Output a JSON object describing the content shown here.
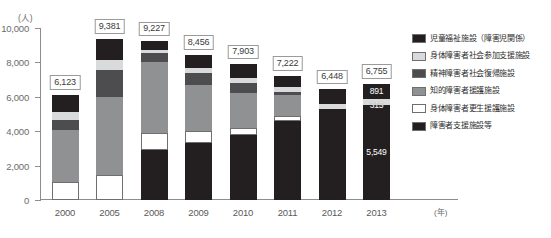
{
  "chart_data": {
    "type": "bar",
    "subtype": "stacked-vertical",
    "title": "",
    "subtitle": "",
    "xlabel": "(年)",
    "ylabel": "(人)",
    "ylim": [
      0,
      10000
    ],
    "ytick_labels": [
      "10,000",
      "8,000",
      "6,000",
      "4,000",
      "2,000",
      "0"
    ],
    "ytick_values": [
      10000,
      8000,
      6000,
      4000,
      2000,
      0
    ],
    "grid": false,
    "legend_position": "right",
    "categories": [
      "2000",
      "2005",
      "2008",
      "2009",
      "2010",
      "2011",
      "2012",
      "2013"
    ],
    "totals": [
      6123,
      9381,
      9227,
      8456,
      7903,
      7222,
      6448,
      6755
    ],
    "total_labels": [
      "6,123",
      "9,381",
      "9,227",
      "8,456",
      "7,903",
      "7,222",
      "6,448",
      "6,755"
    ],
    "series": [
      {
        "name": "障害者支援施設等",
        "color": "#231f20",
        "values": [
          0,
          0,
          2880,
          3320,
          3760,
          4620,
          5280,
          5549
        ]
      },
      {
        "name": "身体障害者更生援護施設",
        "color": "#ffffff",
        "values": [
          1060,
          1440,
          1010,
          700,
          430,
          290,
          0,
          0
        ]
      },
      {
        "name": "知的障害者援護施設",
        "color": "#8f9193",
        "values": [
          3000,
          4560,
          4130,
          2660,
          2030,
          1220,
          0,
          0
        ]
      },
      {
        "name": "精神障害者社会復帰施設",
        "color": "#4d4d4f",
        "values": [
          580,
          1570,
          510,
          690,
          610,
          160,
          0,
          0
        ]
      },
      {
        "name": "身体障害者社会参加支援施設",
        "color": "#d9dadb",
        "values": [
          460,
          580,
          190,
          300,
          290,
          270,
          315,
          315
        ]
      },
      {
        "name": "児童福祉施設（障害児関係）",
        "color": "#231f20",
        "values": [
          1023,
          1231,
          507,
          786,
          783,
          662,
          853,
          891
        ]
      }
    ],
    "segment_labels": {
      "2013": {
        "児童福祉施設（障害児関係）": "891",
        "身体障害者社会参加支援施設": "315",
        "障害者支援施設等": "5,549"
      }
    },
    "legend": [
      {
        "label": "児童福祉施設（障害児関係）",
        "color": "#231f20"
      },
      {
        "label": "身体障害者社会参加支援施設",
        "color": "#d9dadb"
      },
      {
        "label": "精神障害者社会復帰施設",
        "color": "#4d4d4f"
      },
      {
        "label": "知的障害者援護施設",
        "color": "#8f9193"
      },
      {
        "label": "身体障害者更生援護施設",
        "color": "#ffffff"
      },
      {
        "label": "障害者支援施設等",
        "color": "#231f20"
      }
    ]
  }
}
